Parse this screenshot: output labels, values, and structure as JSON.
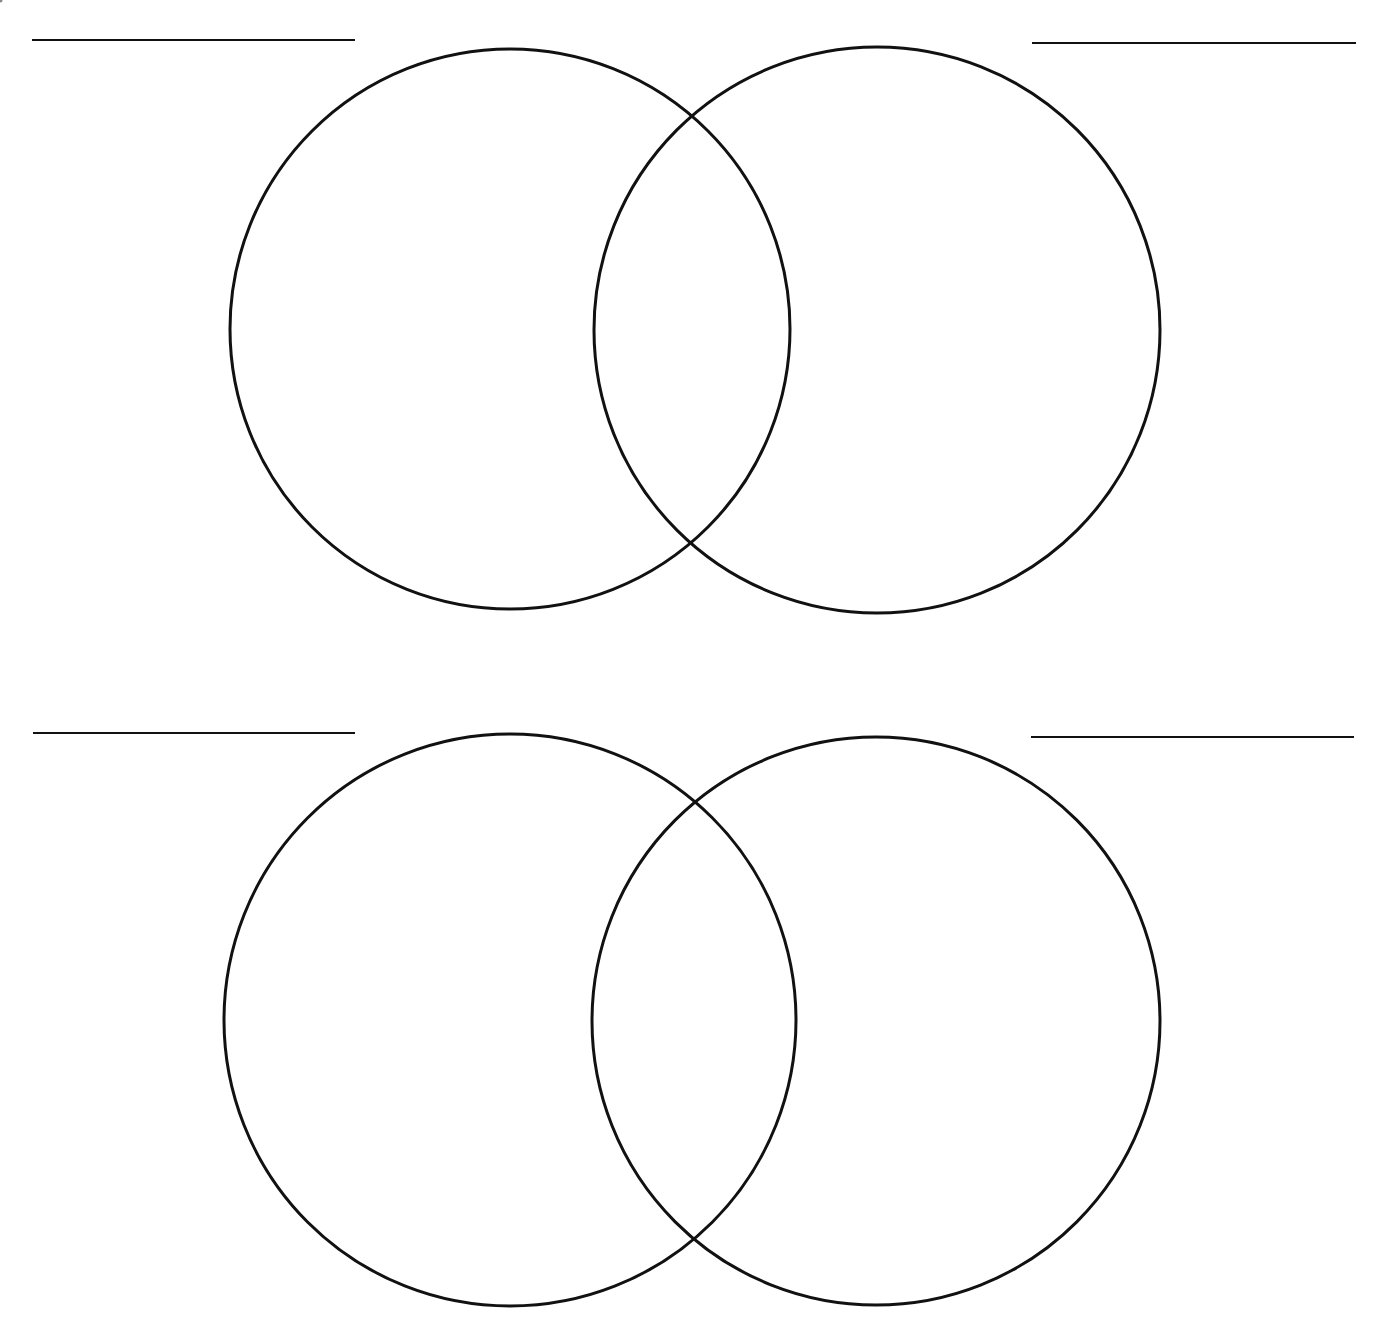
{
  "diagram": {
    "type": "venn-worksheet",
    "stroke_color": "#111111",
    "background_color": "#ffffff",
    "venns": [
      {
        "id": "venn-top",
        "label_lines": [
          {
            "x1": 32,
            "y1": 40,
            "x2": 355,
            "y2": 40
          },
          {
            "x1": 1032,
            "y1": 43,
            "x2": 1356,
            "y2": 43
          }
        ],
        "circles": [
          {
            "cx": 510,
            "cy": 329,
            "r": 280
          },
          {
            "cx": 877,
            "cy": 330,
            "r": 283
          }
        ]
      },
      {
        "id": "venn-bottom",
        "label_lines": [
          {
            "x1": 33,
            "y1": 733,
            "x2": 355,
            "y2": 733
          },
          {
            "x1": 1031,
            "y1": 737,
            "x2": 1354,
            "y2": 737
          }
        ],
        "circles": [
          {
            "cx": 510,
            "cy": 1020,
            "r": 286
          },
          {
            "cx": 876,
            "cy": 1021,
            "r": 284
          }
        ]
      }
    ],
    "specks": [
      {
        "x": 166,
        "y": 996,
        "r": 2.5
      }
    ]
  }
}
